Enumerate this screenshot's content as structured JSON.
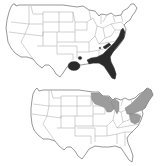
{
  "figure": {
    "panels": [
      {
        "id": "top",
        "region": "Contiguous United States",
        "range_fill_color": "#2b2b2b",
        "range_description": "Southeastern coastal plain from Virginia/Maryland south through the Carolinas, Georgia, Florida, and the Gulf Coast to Louisiana and east Texas; small outlier in Kentucky/Tennessee",
        "shaded_states": [
          "MD",
          "VA",
          "NC",
          "SC",
          "GA",
          "FL",
          "AL",
          "MS",
          "LA",
          "TX",
          "TN",
          "KY",
          "AR"
        ]
      },
      {
        "id": "bottom",
        "region": "Contiguous United States",
        "range_fill_color": "#9c9c9c",
        "range_description": "Northeastern and Great Lakes region: Minnesota, Wisconsin, Michigan, New York, Pennsylvania, New Jersey, Maryland, and New England",
        "shaded_states": [
          "MN",
          "WI",
          "MI",
          "NY",
          "PA",
          "NJ",
          "MD",
          "VT",
          "NH",
          "ME",
          "MA",
          "CT",
          "RI"
        ]
      }
    ]
  }
}
